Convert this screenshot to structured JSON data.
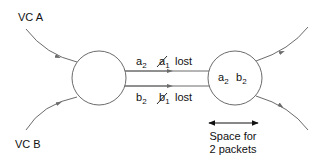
{
  "diagram": {
    "type": "virtual-circuit packet loss",
    "inputs": [
      {
        "id": "vc-a",
        "label": "VC A"
      },
      {
        "id": "vc-b",
        "label": "VC B"
      }
    ],
    "link": {
      "top": {
        "delivered": {
          "base": "a",
          "sub": "2"
        },
        "lost": {
          "base": "a",
          "sub": "1",
          "struck": true
        },
        "lost_label": "lost"
      },
      "bottom": {
        "delivered": {
          "base": "b",
          "sub": "2"
        },
        "lost": {
          "base": "b",
          "sub": "1",
          "struck": true
        },
        "lost_label": "lost"
      }
    },
    "buffer": {
      "contents": [
        {
          "base": "a",
          "sub": "2"
        },
        {
          "base": "b",
          "sub": "2"
        }
      ],
      "annotation_line1": "Space for",
      "annotation_line2": "2 packets"
    },
    "colors": {
      "line": "#6b6b6b",
      "text": "#111111",
      "background": "#ffffff"
    }
  }
}
